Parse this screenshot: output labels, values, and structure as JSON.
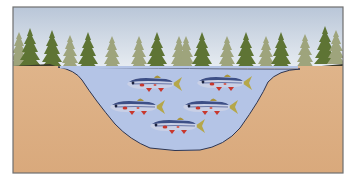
{
  "illustration": {
    "subject": "pond cross-section with conifer trees and a school of fish",
    "frame": {
      "x": 13,
      "y": 7,
      "width": 330,
      "height": 166
    },
    "colors": {
      "sky_top": "#b9c6d8",
      "sky_bottom": "#e9eef3",
      "water": "#b4c4e6",
      "soil": "#dcae82",
      "shore_line": "#2e3550",
      "tree_dark": "#5e7434",
      "tree_light": "#9ea47c",
      "frame": "#6f6f6f",
      "fish_body": "#c9d0e6",
      "fish_back": "#3d4f86",
      "fish_red": "#c8372d",
      "fish_tail": "#b5a74a"
    },
    "fish": [
      {
        "cx": 152,
        "cy": 84
      },
      {
        "cx": 222,
        "cy": 83
      },
      {
        "cx": 135,
        "cy": 107
      },
      {
        "cx": 208,
        "cy": 107
      },
      {
        "cx": 175,
        "cy": 126
      }
    ],
    "fish_count": 5
  }
}
